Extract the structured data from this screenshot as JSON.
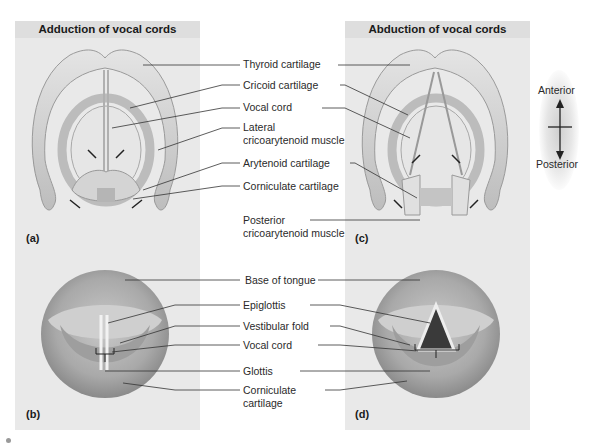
{
  "figure": {
    "panels": {
      "a": {
        "letter": "(a)",
        "title": "Adduction of vocal cords"
      },
      "b": {
        "letter": "(b)"
      },
      "c": {
        "letter": "(c)",
        "title": "Abduction of vocal cords"
      },
      "d": {
        "letter": "(d)"
      }
    },
    "top_labels": [
      {
        "text": "Thyroid cartilage"
      },
      {
        "text": "Cricoid cartilage"
      },
      {
        "text": "Vocal cord"
      },
      {
        "line1": "Lateral",
        "line2": "cricoarytenoid muscle"
      },
      {
        "text": "Arytenoid cartilage"
      },
      {
        "text": "Corniculate cartilage"
      },
      {
        "line1": "Posterior",
        "line2": "cricoarytenoid muscle"
      }
    ],
    "bottom_labels": [
      {
        "text": "Base of tongue"
      },
      {
        "text": "Epiglottis"
      },
      {
        "text": "Vestibular fold"
      },
      {
        "text": "Vocal cord"
      },
      {
        "text": "Glottis"
      },
      {
        "line1": "Corniculate",
        "line2": "cartilage"
      }
    ],
    "orientation": {
      "top": "Anterior",
      "bottom": "Posterior"
    },
    "colors": {
      "panel_bg": "#e9e9e9",
      "header_bg": "#dedede",
      "cartilage": "#d6d6d6",
      "leader_line": "#333333"
    }
  }
}
